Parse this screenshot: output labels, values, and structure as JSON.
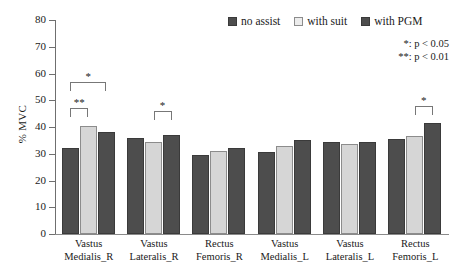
{
  "chart_data": {
    "type": "bar",
    "title": "",
    "xlabel": "",
    "ylabel": "% MVC",
    "ylim": [
      0,
      80
    ],
    "yticks": [
      0,
      10,
      20,
      30,
      40,
      50,
      60,
      70,
      80
    ],
    "grid": false,
    "legend_position": "top-right",
    "categories": [
      "Vastus Medialis_R",
      "Vastus Lateralis_R",
      "Rectus Femoris_R",
      "Vastus Medialis_L",
      "Vastus Lateralis_L",
      "Rectus Femoris_L"
    ],
    "category_lines": [
      [
        "Vastus",
        "Medialis_R"
      ],
      [
        "Vastus",
        "Lateralis_R"
      ],
      [
        "Rectus",
        "Femoris_R"
      ],
      [
        "Vastus",
        "Medialis_L"
      ],
      [
        "Vastus",
        "Lateralis_L"
      ],
      [
        "Rectus",
        "Femoris_L"
      ]
    ],
    "series": [
      {
        "name": "no assist",
        "color": "#4d4d4d",
        "values": [
          32.0,
          36.0,
          29.5,
          30.5,
          34.5,
          35.5
        ]
      },
      {
        "name": "with suit",
        "color": "#d6d6d6",
        "values": [
          40.5,
          34.5,
          31.0,
          33.0,
          33.5,
          36.5
        ]
      },
      {
        "name": "with PGM",
        "color": "#4d4d4d",
        "values": [
          38.0,
          37.0,
          32.0,
          35.0,
          34.5,
          41.5
        ]
      }
    ],
    "annotations": [
      {
        "group": 0,
        "from_series": 0,
        "to_series": 2,
        "label": "*",
        "y": 57.0
      },
      {
        "group": 0,
        "from_series": 0,
        "to_series": 1,
        "label": "**",
        "y": 47.0
      },
      {
        "group": 1,
        "from_series": 1,
        "to_series": 2,
        "label": "*",
        "y": 46.0
      },
      {
        "group": 5,
        "from_series": 1,
        "to_series": 2,
        "label": "*",
        "y": 48.0
      }
    ]
  },
  "legend": {
    "items": [
      {
        "label": "no assist"
      },
      {
        "label": "with suit"
      },
      {
        "label": "with PGM"
      }
    ]
  },
  "notes": {
    "line1": "*: p < 0.05",
    "line2": "**: p < 0.01"
  }
}
